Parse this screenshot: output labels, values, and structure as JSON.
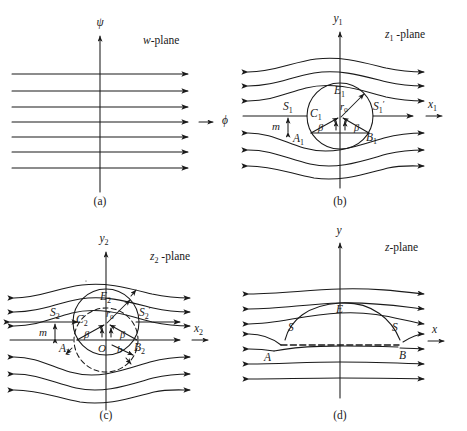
{
  "figure": {
    "background": "#ffffff",
    "ink": "#1a1a1a"
  },
  "panels": [
    {
      "id": "a",
      "caption": "(a)",
      "plane_label": "w-plane",
      "vertical_axis_label": "ψ",
      "horizontal_axis_label": "ϕ",
      "streamline_count": 7,
      "streamline_shape": "straight",
      "labels": []
    },
    {
      "id": "b",
      "caption": "(b)",
      "plane_label": "z₁ -plane",
      "vertical_axis_label": "y",
      "vertical_axis_sub": "1",
      "horizontal_axis_label": "x",
      "horizontal_axis_sub": "1",
      "streamline_count": 7,
      "streamline_shape": "curved-around-circle",
      "labels": [
        {
          "name": "center",
          "text": "C",
          "sub": "1"
        },
        {
          "name": "top-point",
          "text": "E",
          "sub": "1"
        },
        {
          "name": "radius",
          "text": "r",
          "sub": "o"
        },
        {
          "name": "stagnation-left",
          "text": "S",
          "sub": "1"
        },
        {
          "name": "stagnation-right",
          "text": "S",
          "sub": "1",
          "prime": true
        },
        {
          "name": "chord-left",
          "text": "A",
          "sub": "1"
        },
        {
          "name": "chord-right",
          "text": "B",
          "sub": "1"
        },
        {
          "name": "offset",
          "text": "m"
        },
        {
          "name": "angle-left",
          "text": "β"
        },
        {
          "name": "angle-right",
          "text": "β"
        }
      ]
    },
    {
      "id": "c",
      "caption": "(c)",
      "plane_label": "z₂ -plane",
      "vertical_axis_label": "y",
      "vertical_axis_sub": "2",
      "horizontal_axis_label": "x",
      "horizontal_axis_sub": "2",
      "streamline_count": 7,
      "streamline_shape": "curved-around-circle",
      "labels": [
        {
          "name": "center",
          "text": "C",
          "sub": "2"
        },
        {
          "name": "top-point",
          "text": "E",
          "sub": "2"
        },
        {
          "name": "radius",
          "text": "r",
          "sub": "o"
        },
        {
          "name": "stagnation-left",
          "text": "S",
          "sub": "2"
        },
        {
          "name": "stagnation-right",
          "text": "S",
          "sub": "2",
          "prime": true
        },
        {
          "name": "chord-left",
          "text": "A",
          "sub": "2"
        },
        {
          "name": "chord-right",
          "text": "B",
          "sub": "2"
        },
        {
          "name": "origin",
          "text": "O"
        },
        {
          "name": "half-chord",
          "text": "b"
        },
        {
          "name": "offset",
          "text": "m"
        },
        {
          "name": "angle-left",
          "text": "β"
        },
        {
          "name": "angle-right",
          "text": "β"
        }
      ]
    },
    {
      "id": "d",
      "caption": "(d)",
      "plane_label": "z-plane",
      "vertical_axis_label": "y",
      "horizontal_axis_label": "x",
      "streamline_count": 7,
      "streamline_shape": "curved-around-aerofoil",
      "labels": [
        {
          "name": "stagnation-left",
          "text": "S"
        },
        {
          "name": "stagnation-right",
          "text": "S"
        },
        {
          "name": "top-point",
          "text": "E"
        },
        {
          "name": "leading-edge",
          "text": "A"
        },
        {
          "name": "trailing-edge",
          "text": "B"
        }
      ]
    }
  ]
}
